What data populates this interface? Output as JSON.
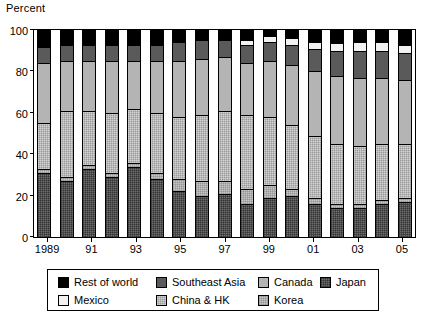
{
  "chart_data": {
    "type": "bar",
    "subtype": "stacked-bar-percent",
    "title": "",
    "ylabel": "Percent",
    "xlabel": "",
    "ylim": [
      0,
      100
    ],
    "yticks": [
      0,
      20,
      40,
      60,
      80,
      100
    ],
    "grid": false,
    "legend_position": "bottom",
    "x": [
      "1989",
      "1990",
      "1991",
      "1992",
      "1993",
      "1994",
      "1995",
      "1996",
      "1997",
      "1998",
      "1999",
      "2000",
      "2001",
      "2002",
      "2003",
      "2004",
      "2005"
    ],
    "categories": [
      "1989",
      "1990",
      "1991",
      "1992",
      "1993",
      "1994",
      "1995",
      "1996",
      "1997",
      "1998",
      "1999",
      "2000",
      "2001",
      "2002",
      "2003",
      "2004",
      "2005"
    ],
    "xtick_labels": [
      "1989",
      "91",
      "93",
      "95",
      "97",
      "99",
      "01",
      "03",
      "05"
    ],
    "xtick_indices": [
      0,
      2,
      4,
      6,
      8,
      10,
      12,
      14,
      16
    ],
    "stack_order_bottom_to_top": [
      "Japan",
      "Korea",
      "China & HK",
      "Canada",
      "Southeast Asia",
      "Mexico",
      "Rest of world"
    ],
    "series": [
      {
        "name": "Japan",
        "color": "#6e6e6e",
        "values": [
          31,
          27,
          33,
          29,
          34,
          28,
          22,
          20,
          21,
          16,
          19,
          20,
          16,
          14,
          14,
          16,
          17
        ]
      },
      {
        "name": "Korea",
        "color": "#c6c6c6",
        "values": [
          2,
          2,
          2,
          2,
          2,
          3,
          6,
          7,
          6,
          7,
          6,
          3,
          3,
          2,
          2,
          2,
          2
        ]
      },
      {
        "name": "China & HK",
        "color": "#9a9a9a",
        "values": [
          22,
          32,
          26,
          29,
          26,
          29,
          30,
          32,
          34,
          36,
          33,
          31,
          30,
          29,
          28,
          27,
          26
        ]
      },
      {
        "name": "Canada",
        "color": "#b4b4b4",
        "values": [
          29,
          24,
          24,
          25,
          23,
          25,
          27,
          27,
          26,
          25,
          27,
          29,
          31,
          33,
          33,
          32,
          31
        ]
      },
      {
        "name": "Southeast Asia",
        "color": "#5a5a5a",
        "values": [
          8,
          8,
          8,
          8,
          8,
          8,
          9,
          9,
          8,
          9,
          9,
          10,
          11,
          12,
          13,
          13,
          13
        ]
      },
      {
        "name": "Mexico",
        "color": "#f2f2f2",
        "values": [
          0,
          0,
          0,
          0,
          0,
          0,
          0,
          0,
          0,
          2,
          3,
          3,
          3,
          4,
          4,
          4,
          4
        ]
      },
      {
        "name": "Rest of world",
        "color": "#000000",
        "values": [
          8,
          7,
          7,
          7,
          7,
          7,
          6,
          5,
          5,
          5,
          3,
          4,
          6,
          6,
          6,
          6,
          7
        ]
      }
    ]
  },
  "legend": {
    "items": [
      {
        "label": "Rest of world",
        "swatch": "fill-rest",
        "row": 0,
        "col": 0
      },
      {
        "label": "Southeast Asia",
        "swatch": "fill-sea",
        "row": 0,
        "col": 1
      },
      {
        "label": "Canada",
        "swatch": "fill-canada",
        "row": 0,
        "col": 2
      },
      {
        "label": "Japan",
        "swatch": "fill-japan",
        "row": 0,
        "col": 3
      },
      {
        "label": "Mexico",
        "swatch": "fill-mexico",
        "row": 1,
        "col": 0
      },
      {
        "label": "China & HK",
        "swatch": "fill-china",
        "row": 1,
        "col": 1
      },
      {
        "label": "Korea",
        "swatch": "fill-korea",
        "row": 1,
        "col": 2
      }
    ]
  }
}
